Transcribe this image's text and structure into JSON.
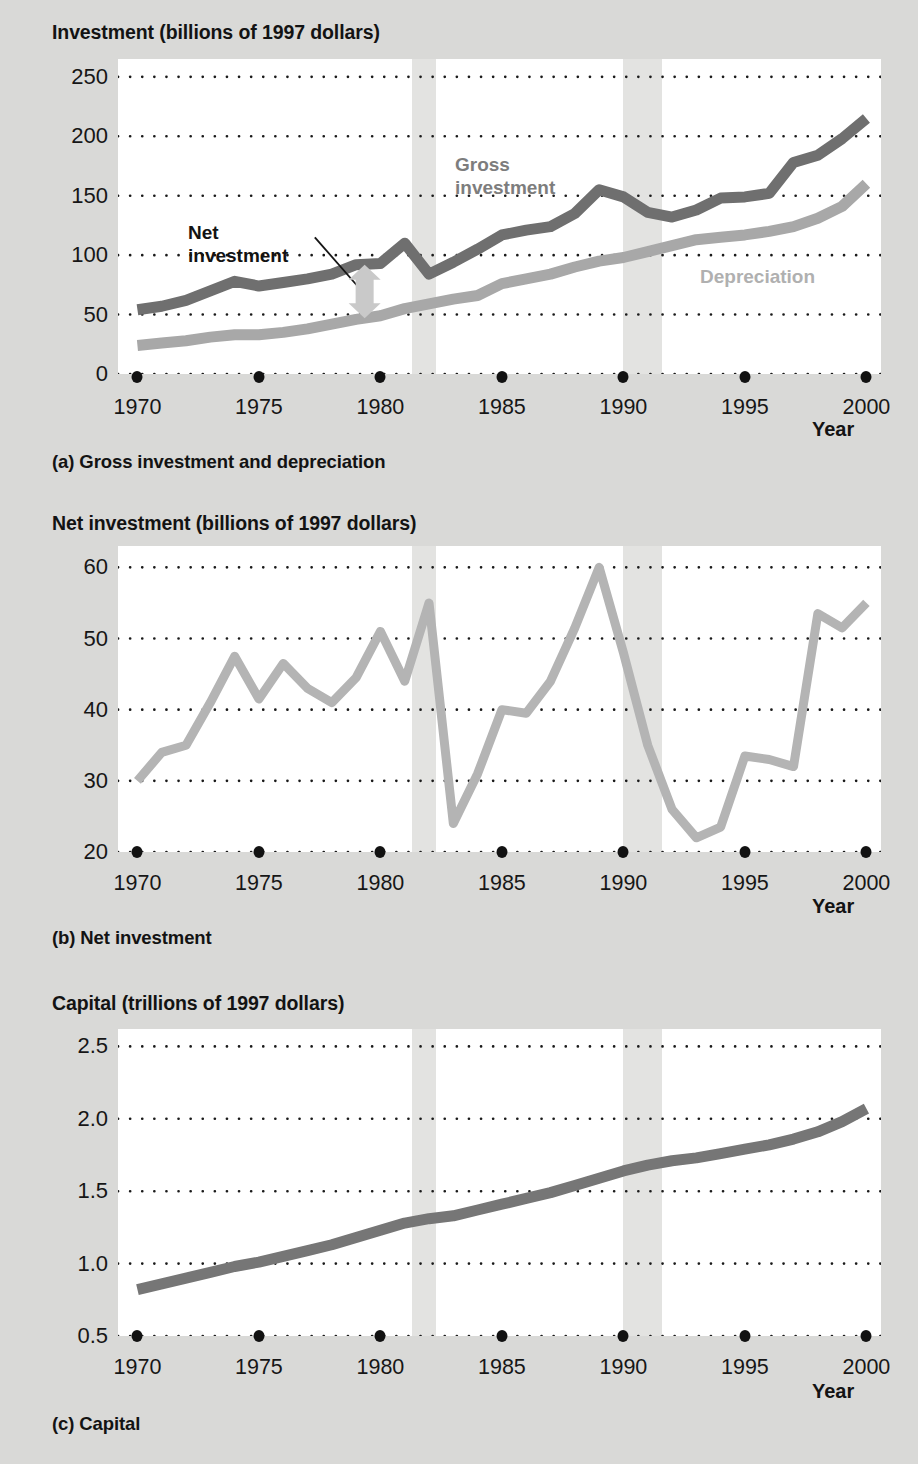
{
  "page": {
    "background_color": "#d9d9d7",
    "plot_background_color": "#ffffff",
    "recession_band_color": "#e3e3e1",
    "gross_color": "#6f6f6f",
    "depreciation_color": "#a8a8a8",
    "net_color": "#b4b4b4",
    "capital_color": "#767676",
    "arrow_color": "#c9c9c9",
    "text_color": "#131313"
  },
  "panel_a": {
    "axis_title": "Investment (billions of 1997 dollars)",
    "caption": "(a) Gross investment and depreciation",
    "year_label": "Year",
    "labels": {
      "gross_line1": "Gross",
      "gross_line2": "investment",
      "net_line1": "Net",
      "net_line2": "investment",
      "depreciation": "Depreciation"
    }
  },
  "panel_b": {
    "axis_title": "Net investment (billions of 1997 dollars)",
    "caption": "(b) Net investment",
    "year_label": "Year"
  },
  "panel_c": {
    "axis_title": "Capital (trillions of 1997 dollars)",
    "caption": "(c) Capital",
    "year_label": "Year"
  },
  "chart_data": [
    {
      "id": "panel_a",
      "type": "line",
      "title": "Investment (billions of 1997 dollars)",
      "subtitle": "(a) Gross investment and depreciation",
      "xlabel": "Year",
      "ylabel": "Investment (billions of 1997 dollars)",
      "xlim": [
        1969.2,
        2000.6
      ],
      "ylim": [
        0,
        265
      ],
      "yticks": [
        0,
        50,
        100,
        150,
        200,
        250
      ],
      "ytick_labels": [
        "0",
        "50",
        "100",
        "150",
        "200",
        "250"
      ],
      "xticks": [
        1970,
        1975,
        1980,
        1985,
        1990,
        1995,
        2000
      ],
      "xtick_labels": [
        "1970",
        "1975",
        "1980",
        "1985",
        "1990",
        "1995",
        "2000"
      ],
      "grid": "horizontal-dotted",
      "legend": "inline-annotations",
      "annotations": [
        {
          "text": "Gross investment",
          "x": 1986.5,
          "y": 180,
          "color": "#7d7d7d"
        },
        {
          "text": "Net investment",
          "x": 1976.0,
          "y": 125,
          "color": "#131313",
          "leader": true
        },
        {
          "text": "Depreciation",
          "x": 1995.0,
          "y": 96,
          "color": "#b0b0b0"
        }
      ],
      "shaded_regions": [
        {
          "label": "recession",
          "x0": 1981.3,
          "x1": 1982.3
        },
        {
          "label": "recession",
          "x0": 1990.0,
          "x1": 1991.6
        }
      ],
      "x": [
        1970,
        1971,
        1972,
        1973,
        1974,
        1975,
        1976,
        1977,
        1978,
        1979,
        1980,
        1981,
        1982,
        1983,
        1984,
        1985,
        1986,
        1987,
        1988,
        1989,
        1990,
        1991,
        1992,
        1993,
        1994,
        1995,
        1996,
        1997,
        1998,
        1999,
        2000
      ],
      "series": [
        {
          "name": "Gross investment",
          "color": "#6f6f6f",
          "values": [
            54,
            57,
            62,
            70,
            78,
            74,
            77,
            80,
            84,
            92,
            93,
            110,
            84,
            94,
            105,
            117,
            121,
            124,
            135,
            155,
            149,
            136,
            132,
            138,
            148,
            149,
            152,
            178,
            184,
            198,
            215
          ]
        },
        {
          "name": "Depreciation",
          "color": "#a8a8a8",
          "values": [
            24,
            26,
            28,
            31,
            33,
            33,
            35,
            38,
            42,
            46,
            49,
            55,
            59,
            63,
            66,
            76,
            80,
            84,
            90,
            95,
            98,
            103,
            108,
            113,
            115,
            117,
            120,
            124,
            131,
            141,
            160
          ]
        }
      ]
    },
    {
      "id": "panel_b",
      "type": "line",
      "title": "Net investment (billions of 1997 dollars)",
      "subtitle": "(b) Net investment",
      "xlabel": "Year",
      "ylabel": "Net investment (billions of 1997 dollars)",
      "xlim": [
        1969.2,
        2000.6
      ],
      "ylim": [
        20,
        63
      ],
      "yticks": [
        20,
        30,
        40,
        50,
        60
      ],
      "ytick_labels": [
        "20",
        "30",
        "40",
        "50",
        "60"
      ],
      "xticks": [
        1970,
        1975,
        1980,
        1985,
        1990,
        1995,
        2000
      ],
      "xtick_labels": [
        "1970",
        "1975",
        "1980",
        "1985",
        "1990",
        "1995",
        "2000"
      ],
      "grid": "horizontal-dotted",
      "shaded_regions": [
        {
          "label": "recession",
          "x0": 1981.3,
          "x1": 1982.3
        },
        {
          "label": "recession",
          "x0": 1990.0,
          "x1": 1991.6
        }
      ],
      "x": [
        1970,
        1971,
        1972,
        1973,
        1974,
        1975,
        1976,
        1977,
        1978,
        1979,
        1980,
        1981,
        1982,
        1983,
        1984,
        1985,
        1986,
        1987,
        1988,
        1989,
        1990,
        1991,
        1992,
        1993,
        1994,
        1995,
        1996,
        1997,
        1998,
        1999,
        2000
      ],
      "series": [
        {
          "name": "Net investment",
          "color": "#b4b4b4",
          "values": [
            30,
            34,
            35,
            41,
            47.5,
            41.5,
            46.5,
            43,
            41,
            44.5,
            51,
            44,
            55,
            24,
            31,
            40,
            39.5,
            44,
            51.5,
            60,
            48,
            35,
            26,
            22,
            23.5,
            33.5,
            33,
            32,
            53.5,
            51.5,
            55
          ]
        }
      ]
    },
    {
      "id": "panel_c",
      "type": "line",
      "title": "Capital (trillions of 1997 dollars)",
      "subtitle": "(c) Capital",
      "xlabel": "Year",
      "ylabel": "Capital (trillions of 1997 dollars)",
      "xlim": [
        1969.2,
        2000.6
      ],
      "ylim": [
        0.5,
        2.62
      ],
      "yticks": [
        0.5,
        1.0,
        1.5,
        2.0,
        2.5
      ],
      "ytick_labels": [
        "0.5",
        "1.0",
        "1.5",
        "2.0",
        "2.5"
      ],
      "xticks": [
        1970,
        1975,
        1980,
        1985,
        1990,
        1995,
        2000
      ],
      "xtick_labels": [
        "1970",
        "1975",
        "1980",
        "1985",
        "1990",
        "1995",
        "2000"
      ],
      "grid": "horizontal-dotted",
      "shaded_regions": [
        {
          "label": "recession",
          "x0": 1981.3,
          "x1": 1982.3
        },
        {
          "label": "recession",
          "x0": 1990.0,
          "x1": 1991.6
        }
      ],
      "x": [
        1970,
        1971,
        1972,
        1973,
        1974,
        1975,
        1976,
        1977,
        1978,
        1979,
        1980,
        1981,
        1982,
        1983,
        1984,
        1985,
        1986,
        1987,
        1988,
        1989,
        1990,
        1991,
        1992,
        1993,
        1994,
        1995,
        1996,
        1997,
        1998,
        1999,
        2000
      ],
      "series": [
        {
          "name": "Capital",
          "color": "#767676",
          "values": [
            0.82,
            0.86,
            0.9,
            0.94,
            0.98,
            1.01,
            1.05,
            1.09,
            1.13,
            1.18,
            1.23,
            1.28,
            1.31,
            1.33,
            1.37,
            1.41,
            1.45,
            1.49,
            1.54,
            1.59,
            1.64,
            1.68,
            1.71,
            1.73,
            1.76,
            1.79,
            1.82,
            1.86,
            1.91,
            1.98,
            2.07
          ]
        }
      ]
    }
  ]
}
